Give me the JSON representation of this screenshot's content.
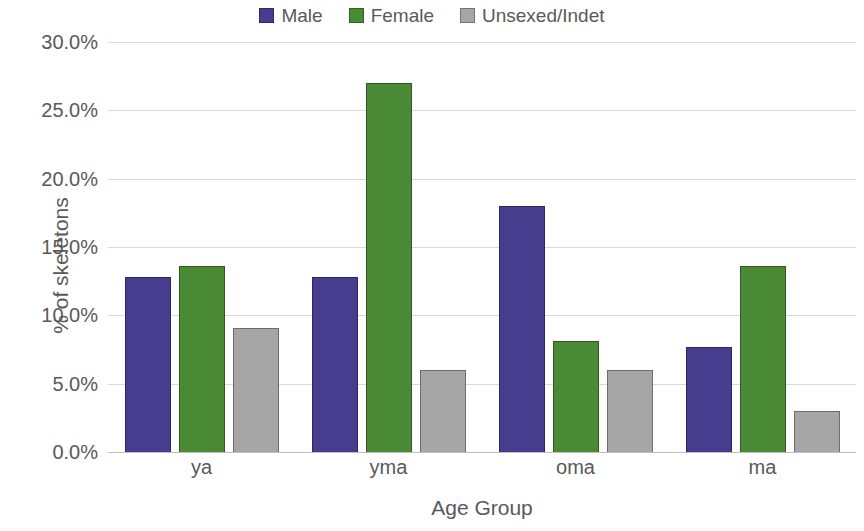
{
  "chart_data": {
    "type": "bar",
    "title": "",
    "xlabel": "Age Group",
    "ylabel": "% of skeletons",
    "categories": [
      "ya",
      "yma",
      "oma",
      "ma"
    ],
    "series": [
      {
        "name": "Male",
        "color": "#463D8E",
        "values": [
          12.8,
          12.8,
          18.0,
          7.7
        ]
      },
      {
        "name": "Female",
        "color": "#4A8A34",
        "values": [
          13.6,
          27.0,
          8.1,
          13.6
        ]
      },
      {
        "name": "Unsexed/Indet",
        "color": "#A6A6A6",
        "values": [
          9.1,
          6.0,
          6.0,
          3.0
        ]
      }
    ],
    "ylim": [
      0,
      30
    ],
    "y_tick_step": 5,
    "y_tick_labels": [
      "30.0%",
      "25.0%",
      "20.0%",
      "15.0%",
      "10.0%",
      "5.0%",
      "0.0%"
    ],
    "y_tick_values": [
      30,
      25,
      20,
      15,
      10,
      5,
      0
    ],
    "grid": true,
    "legend_position": "top"
  }
}
